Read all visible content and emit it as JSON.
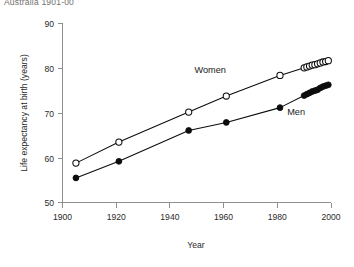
{
  "caption": {
    "top_text": "Australia 1901-00"
  },
  "chart_data": {
    "type": "line",
    "title": "",
    "subtitle": "",
    "xlabel": "Year",
    "ylabel": "Life expectancy at birth (years)",
    "xlim": [
      1900,
      2000
    ],
    "ylim": [
      50,
      90
    ],
    "xticks": [
      1900,
      1920,
      1940,
      1960,
      1980,
      2000
    ],
    "xticklabels": [
      "1900",
      "1920",
      "1940",
      "1960",
      "1980",
      "2000"
    ],
    "yticks": [
      50,
      60,
      70,
      80,
      90
    ],
    "yticklabels": [
      "50",
      "60",
      "70",
      "80",
      "90"
    ],
    "grid": false,
    "legend_position": "inline-annotation",
    "series": [
      {
        "name": "Women",
        "marker": "open-circle",
        "color": "#0c0c0c",
        "annotation": "Women",
        "x": [
          1905,
          1921,
          1947,
          1961,
          1981,
          1990,
          1991,
          1992,
          1993,
          1994,
          1995,
          1996,
          1997,
          1998,
          1999
        ],
        "values": [
          58.8,
          63.5,
          70.2,
          73.8,
          78.4,
          80.1,
          80.3,
          80.5,
          80.7,
          80.8,
          81.0,
          81.2,
          81.4,
          81.5,
          81.7
        ]
      },
      {
        "name": "Men",
        "marker": "filled-circle",
        "color": "#0c0c0c",
        "annotation": "Men",
        "x": [
          1905,
          1921,
          1947,
          1961,
          1981,
          1990,
          1991,
          1992,
          1993,
          1994,
          1995,
          1996,
          1997,
          1998,
          1999
        ],
        "values": [
          55.5,
          59.2,
          66.1,
          67.9,
          71.2,
          73.9,
          74.2,
          74.5,
          74.8,
          75.0,
          75.2,
          75.6,
          75.9,
          76.1,
          76.3
        ]
      }
    ],
    "annotations": [
      {
        "text": "Women",
        "x": 1955,
        "y": 79.0
      },
      {
        "text": "Men",
        "x": 1987,
        "y": 69.5
      }
    ]
  }
}
